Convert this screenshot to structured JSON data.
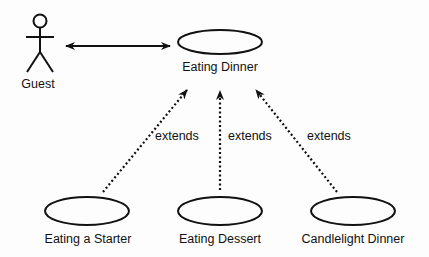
{
  "diagram": {
    "type": "uml-use-case",
    "actor": {
      "name": "Guest"
    },
    "use_cases": [
      {
        "id": "main",
        "label": "Eating Dinner"
      },
      {
        "id": "starter",
        "label": "Eating a Starter"
      },
      {
        "id": "dessert",
        "label": "Eating Dessert"
      },
      {
        "id": "candle",
        "label": "Candlelight Dinner"
      }
    ],
    "relations": [
      {
        "from": "Guest",
        "to": "Eating Dinner",
        "kind": "association",
        "style": "solid-bidirectional"
      },
      {
        "from": "Eating a Starter",
        "to": "Eating Dinner",
        "kind": "extends",
        "label": "extends",
        "style": "dotted"
      },
      {
        "from": "Eating Dessert",
        "to": "Eating Dinner",
        "kind": "extends",
        "label": "extends",
        "style": "dotted"
      },
      {
        "from": "Candlelight Dinner",
        "to": "Eating Dinner",
        "kind": "extends",
        "label": "extends",
        "style": "dotted"
      }
    ],
    "colors": {
      "stroke": "#111111",
      "background": "#fdfdfd"
    }
  }
}
